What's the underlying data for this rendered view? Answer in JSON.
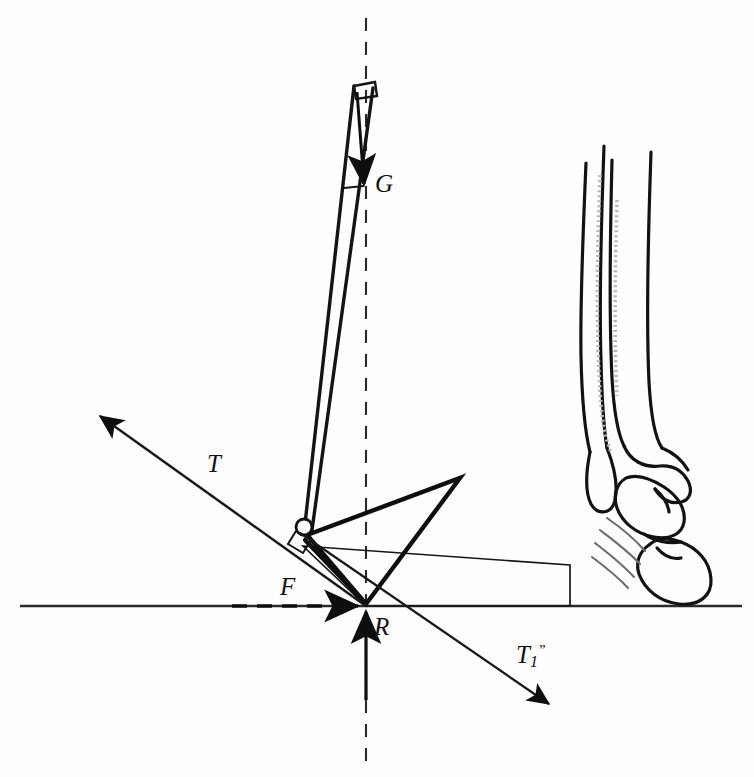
{
  "figure": {
    "kind": "biomechanics-free-body-diagram",
    "background_color": "#fefefe",
    "ink_color": "#101010"
  },
  "labels": {
    "gravity": "G",
    "tendon": "T",
    "friction": "F",
    "reaction": "R",
    "tendon_component_base": "T",
    "tendon_component_sub": "1",
    "tendon_component_prime": "ˮ"
  },
  "geometry": {
    "ground_line_y": 606,
    "vertical_axis_x": 366,
    "joint_center": [
      305,
      528
    ],
    "ground_contact": [
      366,
      606
    ],
    "triangle_apex": [
      460,
      478
    ],
    "canvas": [
      754,
      777
    ]
  },
  "vectors": [
    {
      "name": "G",
      "label": "G",
      "from": [
        359,
        85
      ],
      "to": [
        364,
        188
      ],
      "style": "solid-arrow"
    },
    {
      "name": "T",
      "label": "T",
      "from": [
        366,
        606
      ],
      "to": [
        97,
        413
      ],
      "style": "solid-arrow"
    },
    {
      "name": "F",
      "label": "F",
      "from": [
        236,
        606
      ],
      "to": [
        366,
        606
      ],
      "style": "dashed-arrow"
    },
    {
      "name": "R",
      "label": "R",
      "from": [
        366,
        700
      ],
      "to": [
        366,
        608
      ],
      "style": "solid-arrow"
    },
    {
      "name": "T1",
      "label": "T1",
      "from": [
        305,
        534
      ],
      "to": [
        553,
        707
      ],
      "style": "solid-arrow"
    }
  ],
  "guides": [
    {
      "name": "ground-horizontal",
      "style": "solid",
      "from": [
        20,
        606
      ],
      "to": [
        740,
        606
      ]
    },
    {
      "name": "body-vertical",
      "style": "dashed",
      "from": [
        366,
        18
      ],
      "to": [
        366,
        760
      ]
    }
  ]
}
